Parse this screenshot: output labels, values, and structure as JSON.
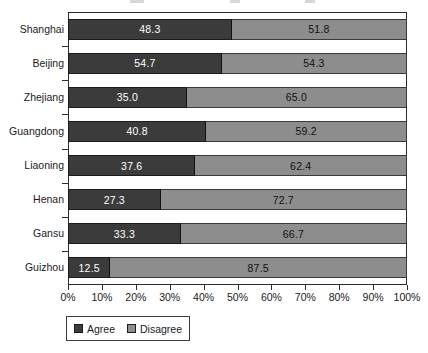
{
  "chart_data": {
    "type": "bar",
    "subtype": "stacked-horizontal-100",
    "title": "",
    "xlabel": "",
    "ylabel": "",
    "orientation": "horizontal",
    "stacked": true,
    "grid": false,
    "xlim": [
      0,
      100
    ],
    "categories": [
      "Shanghai",
      "Beijing",
      "Zhejiang",
      "Guangdong",
      "Liaoning",
      "Henan",
      "Gansu",
      "Guizhou"
    ],
    "series": [
      {
        "name": "Agree",
        "color": "#3b3b3b",
        "values": [
          48.3,
          54.7,
          35.0,
          40.8,
          37.6,
          27.3,
          33.3,
          12.5
        ]
      },
      {
        "name": "Disagree",
        "color": "#8d8d8d",
        "values": [
          51.8,
          54.3,
          65.0,
          59.2,
          62.4,
          72.7,
          66.7,
          87.5
        ]
      }
    ],
    "bar_fractions": {
      "note_hidden": true,
      "agree": [
        48.3,
        45.4,
        35.0,
        40.8,
        37.6,
        27.3,
        33.3,
        12.5
      ]
    },
    "xticks": [
      0,
      10,
      20,
      30,
      40,
      50,
      60,
      70,
      80,
      90,
      100
    ],
    "xticklabels": [
      "0%",
      "10%",
      "20%",
      "30%",
      "40%",
      "50%",
      "60%",
      "70%",
      "80%",
      "90%",
      "100%"
    ],
    "legend": {
      "position": "bottom-left",
      "entries": [
        {
          "label": "Agree",
          "color": "#3b3b3b"
        },
        {
          "label": "Disagree",
          "color": "#8d8d8d"
        }
      ]
    }
  },
  "colors": {
    "agree": "#3b3b3b",
    "disagree": "#8d8d8d",
    "axis": "#2b2b2b",
    "text": "#1a1a1a",
    "background": "#ffffff"
  }
}
